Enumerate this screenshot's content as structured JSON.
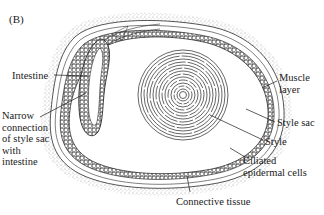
{
  "figure": {
    "panel_label": "(B)",
    "labels": {
      "intestine": "Intestine",
      "narrow_connection": "Narrow\nconnection\nof style sac\nwith\nintestine",
      "muscle_layer": "Muscle\nlayer",
      "style_sac": "Style sac",
      "style": "Style",
      "ciliated_cells": "Ciliated\nepidermal cells",
      "connective_tissue": "Connective tissue"
    },
    "colors": {
      "ink": "#1a1a1a",
      "stipple": "#9a9a9a",
      "background": "#ffffff"
    }
  }
}
